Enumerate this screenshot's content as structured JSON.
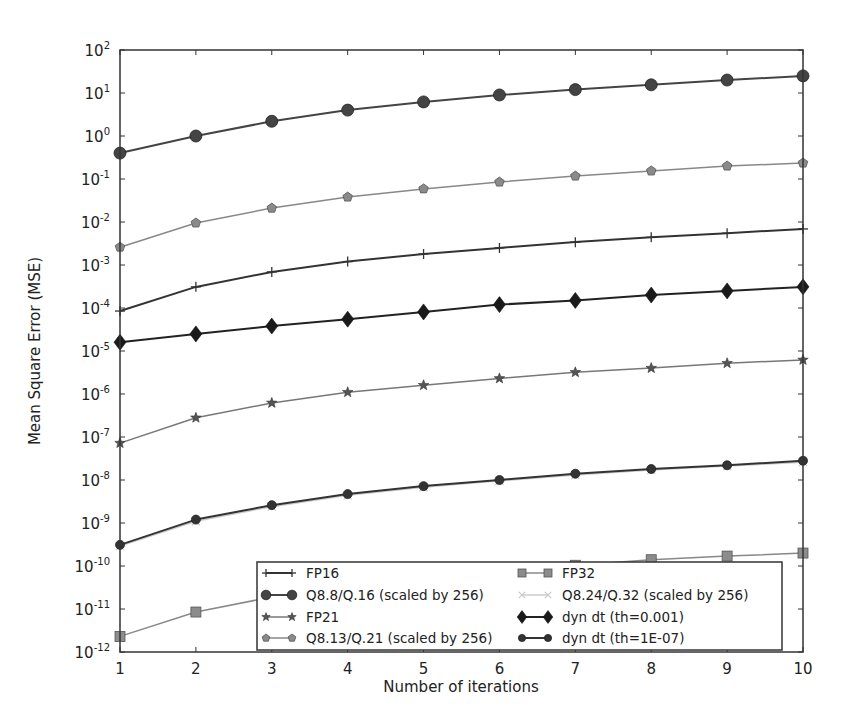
{
  "chart_data": {
    "type": "line",
    "title": "",
    "xlabel": "Number of iterations",
    "ylabel": "Mean Square Error (MSE)",
    "yscale": "log",
    "xlim": [
      1,
      10
    ],
    "ylim": [
      1e-12,
      100
    ],
    "grid": false,
    "legend_position": "lower right (inside, 2 columns)",
    "x": [
      1,
      2,
      3,
      4,
      5,
      6,
      7,
      8,
      9,
      10
    ],
    "x_tick_labels": [
      "1",
      "2",
      "3",
      "4",
      "5",
      "6",
      "7",
      "8",
      "9",
      "10"
    ],
    "y_ticks": [
      {
        "exp": "2"
      },
      {
        "exp": "1"
      },
      {
        "exp": "0"
      },
      {
        "exp": "-1"
      },
      {
        "exp": "-2"
      },
      {
        "exp": "-3"
      },
      {
        "exp": "-4"
      },
      {
        "exp": "-5"
      },
      {
        "exp": "-6"
      },
      {
        "exp": "-7"
      },
      {
        "exp": "-8"
      },
      {
        "exp": "-9"
      },
      {
        "exp": "-10"
      },
      {
        "exp": "-11"
      },
      {
        "exp": "-12"
      }
    ],
    "y_tick_base": "10",
    "series": [
      {
        "name": "FP16",
        "marker": "plus",
        "color": "#333333",
        "line_width": 2,
        "values": [
          8.5e-05,
          0.00031,
          0.00069,
          0.0012,
          0.0018,
          0.0025,
          0.0034,
          0.0044,
          0.0055,
          0.0069
        ]
      },
      {
        "name": "Q8.8/Q.16 (scaled by 256)",
        "marker": "circle",
        "color": "#444444",
        "line_width": 2,
        "values": [
          0.4,
          1.0,
          2.2,
          4.0,
          6.2,
          9.0,
          12.0,
          15.5,
          20.0,
          25.0
        ]
      },
      {
        "name": "FP21",
        "marker": "star",
        "color": "#777777",
        "line_width": 1.5,
        "values": [
          7.2e-08,
          2.8e-07,
          6.2e-07,
          1.1e-06,
          1.6e-06,
          2.3e-06,
          3.2e-06,
          4e-06,
          5.2e-06,
          6.2e-06
        ]
      },
      {
        "name": "Q8.13/Q.21 (scaled by 256)",
        "marker": "pentagon",
        "color": "#888888",
        "line_width": 1.5,
        "values": [
          0.0026,
          0.0095,
          0.021,
          0.038,
          0.059,
          0.085,
          0.117,
          0.154,
          0.2,
          0.235
        ]
      },
      {
        "name": "FP32",
        "marker": "square",
        "color": "#888888",
        "line_width": 1.5,
        "values": [
          2.3e-12,
          8.5e-12,
          1.9e-11,
          3.4e-11,
          5.3e-11,
          7.6e-11,
          1.04e-10,
          1.4e-10,
          1.7e-10,
          2e-10
        ]
      },
      {
        "name": "Q8.24/Q.32 (scaled by 256)",
        "marker": "x",
        "color": "#cccccc",
        "line_width": 1.5,
        "values": [
          2.9e-10,
          1.1e-09,
          2.4e-09,
          4.4e-09,
          6.8e-09,
          9.6e-09,
          1.3e-08,
          1.7e-08,
          2.1e-08,
          2.6e-08
        ]
      },
      {
        "name": "dyn dt (th=0.001)",
        "marker": "diamond",
        "color": "#222222",
        "line_width": 2,
        "values": [
          1.6e-05,
          2.5e-05,
          3.8e-05,
          5.5e-05,
          8.1e-05,
          0.00012,
          0.00015,
          0.0002,
          0.00025,
          0.00031
        ]
      },
      {
        "name": "dyn dt (th=1E-07)",
        "marker": "circle-small",
        "color": "#333333",
        "line_width": 2,
        "values": [
          3.1e-10,
          1.2e-09,
          2.6e-09,
          4.7e-09,
          7.2e-09,
          1e-08,
          1.4e-08,
          1.8e-08,
          2.2e-08,
          2.8e-08
        ]
      }
    ]
  },
  "legend": {
    "columns": [
      [
        "FP16",
        "Q8.8/Q.16 (scaled by 256)",
        "FP21",
        "Q8.13/Q.21 (scaled by 256)"
      ],
      [
        "FP32",
        "Q8.24/Q.32 (scaled by 256)",
        "dyn dt (th=0.001)",
        "dyn dt (th=1E-07)"
      ]
    ]
  }
}
